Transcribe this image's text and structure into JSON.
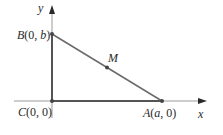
{
  "diagram": {
    "type": "coordinate-triangle",
    "axes": {
      "x_label": "x",
      "y_label": "y"
    },
    "points": {
      "B": {
        "name": "B",
        "coords": "(0, b)",
        "label": "B(0, b)"
      },
      "C": {
        "name": "C",
        "coords": "(0, 0)",
        "label": "C(0, 0)"
      },
      "A": {
        "name": "A",
        "coords": "(a, 0)",
        "label": "A(a, 0)"
      },
      "M": {
        "name": "M",
        "label": "M"
      }
    },
    "colors": {
      "triangle": "#5a5a5a",
      "axis": "#8a8a8a",
      "text": "#2a2a2a",
      "background": "#ffffff"
    }
  }
}
